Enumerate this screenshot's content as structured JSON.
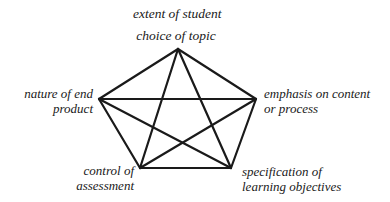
{
  "diagram": {
    "type": "complete-graph-pentagon",
    "nodes": [
      {
        "id": "top",
        "label_lines": [
          "extent of student",
          "choice of topic"
        ],
        "x": 178,
        "y": 49
      },
      {
        "id": "left",
        "label_lines": [
          "nature of end",
          "product"
        ],
        "x": 99,
        "y": 99
      },
      {
        "id": "right",
        "label_lines": [
          "emphasis on content",
          "or process"
        ],
        "x": 256,
        "y": 99
      },
      {
        "id": "bottom-left",
        "label_lines": [
          "control of",
          "assessment"
        ],
        "x": 140,
        "y": 168
      },
      {
        "id": "bottom-right",
        "label_lines": [
          "specification of",
          "learning objectives"
        ],
        "x": 231,
        "y": 168
      }
    ],
    "edges": [
      [
        "top",
        "left"
      ],
      [
        "top",
        "right"
      ],
      [
        "top",
        "bottom-left"
      ],
      [
        "top",
        "bottom-right"
      ],
      [
        "left",
        "right"
      ],
      [
        "left",
        "bottom-left"
      ],
      [
        "left",
        "bottom-right"
      ],
      [
        "right",
        "bottom-left"
      ],
      [
        "right",
        "bottom-right"
      ],
      [
        "bottom-left",
        "bottom-right"
      ]
    ],
    "colors": {
      "line": "#1a1a1a",
      "text": "#1a1a1a",
      "background": "#ffffff"
    }
  },
  "labels": {
    "top": {
      "line1": "extent of student",
      "line2": "choice of topic"
    },
    "left": {
      "line1": "nature of end",
      "line2": "product"
    },
    "right": {
      "line1": "emphasis on content",
      "line2": "or process"
    },
    "bottom_left": {
      "line1": "control of",
      "line2": "assessment"
    },
    "bottom_right": {
      "line1": "specification of",
      "line2": "learning objectives"
    }
  }
}
